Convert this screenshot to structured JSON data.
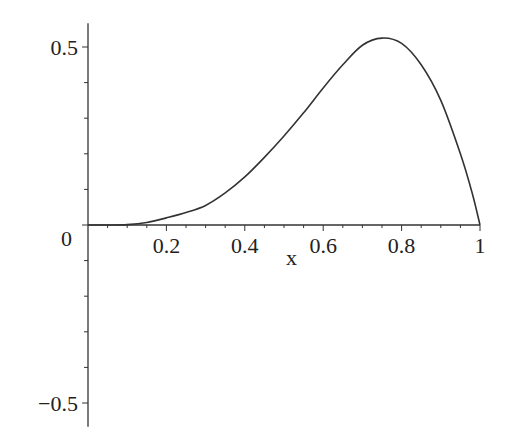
{
  "chart_data": {
    "type": "line",
    "title": "",
    "xlabel": "x",
    "ylabel": "",
    "xlim": [
      0,
      1
    ],
    "ylim": [
      -0.55,
      0.55
    ],
    "grid": false,
    "legend": null,
    "x_ticks": [
      0.2,
      0.4,
      0.6,
      0.8,
      1
    ],
    "x_tick_labels": [
      "0.2",
      "0.4",
      "0.6",
      "0.8",
      "1"
    ],
    "y_ticks": [
      -0.5,
      0,
      0.5
    ],
    "y_tick_labels": [
      "−0.5",
      "0",
      "0.5"
    ],
    "series": [
      {
        "name": "f(x)",
        "color": "#333333",
        "x": [
          0,
          0.05,
          0.1,
          0.15,
          0.2,
          0.25,
          0.3,
          0.35,
          0.4,
          0.45,
          0.5,
          0.55,
          0.6,
          0.65,
          0.7,
          0.75,
          0.8,
          0.85,
          0.9,
          0.95,
          0.98,
          1.0
        ],
        "y": [
          0,
          0.0,
          0.001,
          0.007,
          0.02,
          0.035,
          0.055,
          0.09,
          0.135,
          0.19,
          0.25,
          0.315,
          0.385,
          0.45,
          0.505,
          0.525,
          0.51,
          0.45,
          0.35,
          0.2,
          0.09,
          0
        ]
      }
    ]
  }
}
